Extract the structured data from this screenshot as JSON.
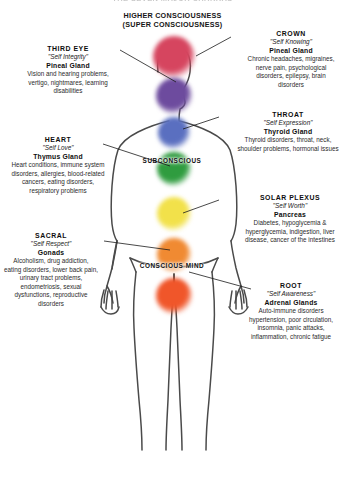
{
  "header": {
    "clipped_title": "THE SEVEN MAJOR CHAKRAS",
    "line1": "HIGHER CONSCIOUSNESS",
    "line2": "(SUPER CONSCIOUSNESS)"
  },
  "mind_labels": {
    "subconscious": "SUBCONSCIOUS",
    "conscious": "CONSCIOUS MIND"
  },
  "chakras": [
    {
      "key": "crown",
      "name": "CROWN",
      "motto": "\"Self Knowing\"",
      "gland": "Pineal Gland",
      "issues": "Chronic headaches, migraines, nerve pain, psychological disorders, epilepsy, brain disorders",
      "color": "#d6455f",
      "side": "right"
    },
    {
      "key": "third-eye",
      "name": "THIRD EYE",
      "motto": "\"Self Integrity\"",
      "gland": "Pineal Gland",
      "issues": "Vision and hearing problems, vertigo, nightmares, learning disabilities",
      "color": "#6d4b9e",
      "side": "left"
    },
    {
      "key": "throat",
      "name": "THROAT",
      "motto": "\"Self Expression\"",
      "gland": "Thyroid Gland",
      "issues": "Thyroid disorders, throat, neck, shoulder problems, hormonal issues",
      "color": "#5a6fc0",
      "side": "right"
    },
    {
      "key": "heart",
      "name": "HEART",
      "motto": "\"Self Love\"",
      "gland": "Thymus Gland",
      "issues": "Heart conditions, immune system disorders, allergies, blood-related cancers, eating disorders, respiratory problems",
      "color": "#2f9c3f",
      "side": "left"
    },
    {
      "key": "solar-plexus",
      "name": "SOLAR PLEXUS",
      "motto": "\"Self Worth\"",
      "gland": "Pancreas",
      "issues": "Diabetes, hypoglycemia & hyperglycemia, indigestion, liver disease, cancer of the intestines",
      "color": "#f2e14a",
      "side": "right"
    },
    {
      "key": "sacral",
      "name": "SACRAL",
      "motto": "\"Self Respect\"",
      "gland": "Gonads",
      "issues": "Alcoholism, drug addiction, eating disorders, lower back pain, urinary tract problems, endometriosis, sexual dysfunctions, reproductive disorders",
      "color": "#f08a32",
      "side": "left"
    },
    {
      "key": "root",
      "name": "ROOT",
      "motto": "\"Self Awareness\"",
      "gland": "Adrenal Glands",
      "issues": "Auto-immune disorders hypertension, poor circulation, insomnia, panic attacks, inflammation, chronic fatigue",
      "color": "#f0562a",
      "side": "right"
    }
  ],
  "figure": {
    "outline_color": "#4a4a4a",
    "background": "#ffffff"
  }
}
